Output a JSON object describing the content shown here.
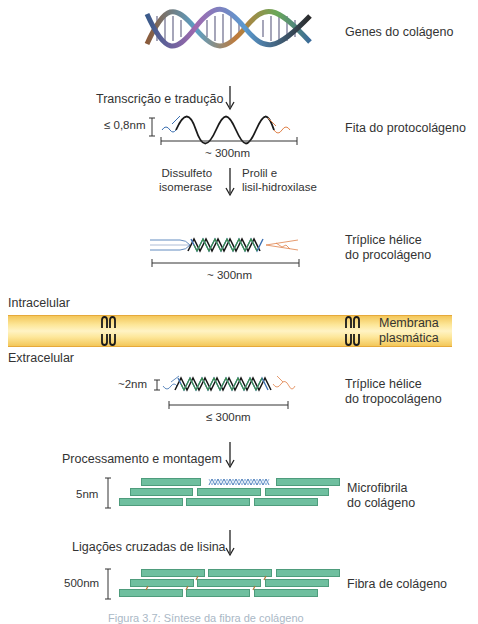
{
  "figure": {
    "stages": [
      {
        "id": "genes",
        "label": "Genes do colágeno"
      },
      {
        "id": "protocollagen",
        "label": "Fita do protocolágeno",
        "width_label": "≤ 0,8nm",
        "length_label": "~ 300nm"
      },
      {
        "id": "procollagen",
        "label_line1": "Tríplice hélice",
        "label_line2": "do procolágeno",
        "length_label": "~ 300nm"
      },
      {
        "id": "tropocollagen",
        "label_line1": "Tríplice hélice",
        "label_line2": "do tropocolágeno",
        "width_label": "~2nm",
        "length_label": "≤ 300nm"
      },
      {
        "id": "microfibril",
        "label_line1": "Microfibrila",
        "label_line2": "do colágeno",
        "height_label": "5nm"
      },
      {
        "id": "fiber",
        "label": "Fibra de colágeno",
        "height_label": "500nm"
      }
    ],
    "steps": {
      "transcription": "Transcrição e tradução",
      "enzyme_left_line1": "Dissulfeto",
      "enzyme_left_line2": "isomerase",
      "enzyme_right_line1": "Prolil e",
      "enzyme_right_line2": "lisil-hidroxilase",
      "processing": "Processamento e montagem",
      "crosslinks": "Ligações cruzadas de lisina"
    },
    "membrane": {
      "intracellular": "Intracelular",
      "extracellular": "Extracelular",
      "label_line1": "Membrana",
      "label_line2": "plasmática",
      "color": "#fde79a"
    },
    "colors": {
      "fibril": "#6fbf9f",
      "strand_blue": "#3b6fb0",
      "strand_green": "#3f8f4a",
      "strand_black": "#1a1a1a",
      "propeptide_orange": "#e0824a"
    },
    "caption": "Figura 3.7: Síntese da fibra de colágeno"
  }
}
